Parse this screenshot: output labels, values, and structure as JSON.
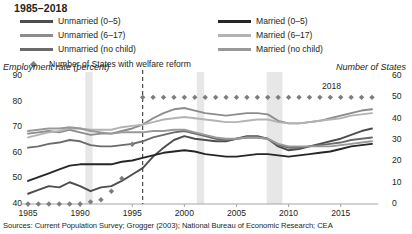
{
  "title": "1985–2018",
  "legend": {
    "left": [
      {
        "label": "Unmarried (0–5)",
        "color": "#4d4d4d",
        "key": "unmarried_0_5"
      },
      {
        "label": "Unmarried (6–17)",
        "color": "#8c8c8c",
        "key": "unmarried_6_17"
      },
      {
        "label": "Unmarried (no child)",
        "color": "#6b6b6b",
        "key": "unmarried_nochild"
      }
    ],
    "right": [
      {
        "label": "Married (0–5)",
        "color": "#262626",
        "key": "married_0_5"
      },
      {
        "label": "Married (6–17)",
        "color": "#b3b3b3",
        "key": "married_6_17"
      },
      {
        "label": "Married (no child)",
        "color": "#999999",
        "key": "married_nochild"
      }
    ],
    "marker": {
      "label": "Number of States with welfare reform",
      "color": "#7d7d7d",
      "shape": "diamond"
    }
  },
  "annotations": {
    "year_label": "2018",
    "welfare_reform_line_year": 1996
  },
  "sources": "Sources: Current Population Survey; Grogger (2003); National Bureau of Economic Research; CEA",
  "chart_data": {
    "type": "line",
    "title": "1985–2018",
    "xlabel": "",
    "ylabel": "Employment rate (percent)",
    "ylabel_right": "Number of States",
    "xlim": [
      1985,
      2018
    ],
    "ylim": [
      40,
      90
    ],
    "ylim_right": [
      0,
      60
    ],
    "yticks": [
      40,
      50,
      60,
      70,
      80,
      90
    ],
    "yticks_right": [
      0,
      10,
      20,
      30,
      40,
      50,
      60
    ],
    "xticks": [
      1985,
      1990,
      1995,
      2000,
      2005,
      2010,
      2015
    ],
    "grid": false,
    "legend_position": "top",
    "x": [
      1985,
      1986,
      1987,
      1988,
      1989,
      1990,
      1991,
      1992,
      1993,
      1994,
      1995,
      1996,
      1997,
      1998,
      1999,
      2000,
      2001,
      2002,
      2003,
      2004,
      2005,
      2006,
      2007,
      2008,
      2009,
      2010,
      2011,
      2012,
      2013,
      2014,
      2015,
      2016,
      2017,
      2018
    ],
    "series": [
      {
        "name": "Unmarried (0–5)",
        "color": "#4d4d4d",
        "axis": "left",
        "values": [
          44.0,
          45.5,
          47.0,
          46.5,
          48.5,
          47.0,
          45.0,
          46.5,
          47.0,
          49.0,
          51.5,
          54.0,
          58.5,
          62.0,
          65.0,
          66.5,
          65.5,
          65.0,
          64.5,
          64.5,
          65.5,
          66.5,
          66.5,
          65.5,
          62.5,
          61.0,
          61.5,
          62.5,
          63.5,
          64.5,
          65.5,
          67.0,
          68.5,
          69.5
        ]
      },
      {
        "name": "Unmarried (6–17)",
        "color": "#8c8c8c",
        "axis": "left",
        "values": [
          67.5,
          68.0,
          68.5,
          68.0,
          69.0,
          68.0,
          67.0,
          67.5,
          67.5,
          68.5,
          69.5,
          71.0,
          73.5,
          75.5,
          77.0,
          77.5,
          76.5,
          75.5,
          75.0,
          74.5,
          75.0,
          75.5,
          75.5,
          75.0,
          72.5,
          71.5,
          71.5,
          72.0,
          72.5,
          73.5,
          74.5,
          75.5,
          76.5,
          77.0
        ]
      },
      {
        "name": "Unmarried (no child)",
        "color": "#6b6b6b",
        "axis": "left",
        "values": [
          62.0,
          62.5,
          63.5,
          64.0,
          65.0,
          64.5,
          63.0,
          62.5,
          62.5,
          63.0,
          63.5,
          64.5,
          66.0,
          67.0,
          68.0,
          68.5,
          67.5,
          66.5,
          65.5,
          65.0,
          65.5,
          66.0,
          66.0,
          65.5,
          63.0,
          62.0,
          62.0,
          62.5,
          63.0,
          63.5,
          64.0,
          65.0,
          65.5,
          66.0
        ]
      },
      {
        "name": "Married (0–5)",
        "color": "#262626",
        "axis": "left",
        "values": [
          49.0,
          50.5,
          52.0,
          53.5,
          55.0,
          55.5,
          55.5,
          55.5,
          55.5,
          56.5,
          57.0,
          58.0,
          59.0,
          60.0,
          60.5,
          61.0,
          60.5,
          59.5,
          59.0,
          58.5,
          58.5,
          59.0,
          59.5,
          59.5,
          59.0,
          58.5,
          59.0,
          59.5,
          60.0,
          60.5,
          61.5,
          62.5,
          63.0,
          63.5
        ]
      },
      {
        "name": "Married (6–17)",
        "color": "#b3b3b3",
        "axis": "left",
        "values": [
          66.0,
          67.0,
          68.0,
          68.5,
          69.5,
          69.5,
          69.0,
          69.0,
          69.0,
          70.0,
          70.5,
          71.0,
          72.0,
          73.0,
          73.5,
          74.0,
          73.5,
          73.0,
          72.5,
          72.0,
          72.0,
          72.5,
          73.0,
          73.0,
          72.0,
          71.5,
          71.5,
          72.0,
          72.5,
          73.0,
          73.5,
          74.5,
          75.0,
          75.5
        ]
      },
      {
        "name": "Married (no child)",
        "color": "#999999",
        "axis": "left",
        "values": [
          68.5,
          69.0,
          69.5,
          69.5,
          70.0,
          69.5,
          68.5,
          68.0,
          67.5,
          68.0,
          68.0,
          68.0,
          68.5,
          68.5,
          69.0,
          69.0,
          68.0,
          67.0,
          66.0,
          65.5,
          65.5,
          66.0,
          66.0,
          65.5,
          63.5,
          62.5,
          62.5,
          62.5,
          62.5,
          62.5,
          63.0,
          63.5,
          64.0,
          64.5
        ]
      }
    ],
    "marker_series": {
      "name": "Number of States with welfare reform",
      "color": "#7d7d7d",
      "axis": "right",
      "shape": "diamond",
      "values": [
        0,
        0,
        0,
        0,
        0,
        0,
        1,
        2,
        6,
        12,
        28,
        50,
        50,
        50,
        50,
        50,
        50,
        50,
        50,
        50,
        50,
        50,
        50,
        50,
        50,
        50,
        50,
        50,
        50,
        50,
        50,
        50,
        50,
        50
      ]
    },
    "recession_bands": [
      {
        "start": 1990.5,
        "end": 1991.2
      },
      {
        "start": 2001.2,
        "end": 2001.9
      },
      {
        "start": 2007.9,
        "end": 2009.4
      }
    ],
    "reference_line": {
      "x": 1996,
      "style": "dashed",
      "label": "welfare reform"
    }
  }
}
